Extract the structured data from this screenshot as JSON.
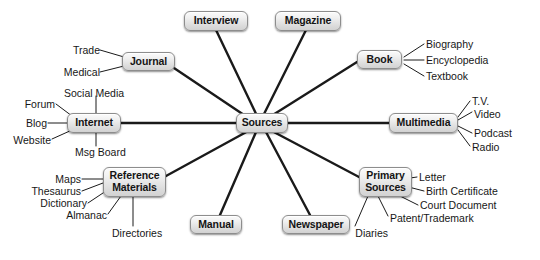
{
  "diagram": {
    "type": "mind-map",
    "title": "Sources",
    "background_color": "#ffffff",
    "node_fill_top": "#fbfbfb",
    "node_fill_bottom": "#d2d2d2",
    "node_border_color": "#8d8d8d",
    "edge_color": "#1a1a1a",
    "root": {
      "label": "Sources"
    },
    "branches": [
      {
        "label": "Interview",
        "children": []
      },
      {
        "label": "Magazine",
        "children": []
      },
      {
        "label": "Journal",
        "children": [
          "Trade",
          "Medical"
        ]
      },
      {
        "label": "Book",
        "children": [
          "Biography",
          "Encyclopedia",
          "Textbook"
        ]
      },
      {
        "label": "Internet",
        "children": [
          "Social Media",
          "Forum",
          "Blog",
          "Website",
          "Msg Board"
        ]
      },
      {
        "label": "Multimedia",
        "children": [
          "T.V.",
          "Video",
          "Podcast",
          "Radio"
        ]
      },
      {
        "label": "Reference Materials",
        "line1": "Reference",
        "line2": "Materials",
        "children": [
          "Maps",
          "Thesaurus",
          "Dictionary",
          "Almanac",
          "Directories"
        ]
      },
      {
        "label": "Primary Sources",
        "line1": "Primary",
        "line2": "Sources",
        "children": [
          "Letter",
          "Birth Certificate",
          "Court Document",
          "Patent/Trademark",
          "Diaries"
        ]
      },
      {
        "label": "Manual",
        "children": []
      },
      {
        "label": "Newspaper",
        "children": []
      }
    ],
    "leaves": {
      "trade": "Trade",
      "medical": "Medical",
      "biography": "Biography",
      "encyclopedia": "Encyclopedia",
      "textbook": "Textbook",
      "social_media": "Social Media",
      "forum": "Forum",
      "blog": "Blog",
      "website": "Website",
      "msg_board": "Msg Board",
      "tv": "T.V.",
      "video": "Video",
      "podcast": "Podcast",
      "radio": "Radio",
      "maps": "Maps",
      "thesaurus": "Thesaurus",
      "dictionary": "Dictionary",
      "almanac": "Almanac",
      "directories": "Directories",
      "letter": "Letter",
      "birth_certificate": "Birth Certificate",
      "court_document": "Court Document",
      "patent_trademark": "Patent/Trademark",
      "diaries": "Diaries"
    }
  }
}
